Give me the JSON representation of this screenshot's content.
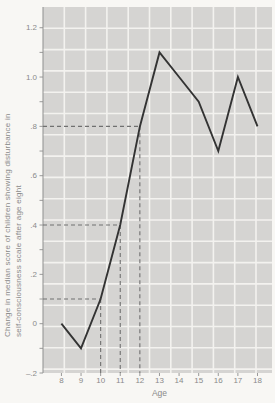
{
  "figure": {
    "paper_color": "#f8f7f4",
    "plot_bg_color": "#d5d4d2",
    "grid_color": "#f3f2ef",
    "line_color": "#333333",
    "dash_color": "#707070",
    "text_color": "#8a8a8a",
    "axis_color": "#8f8f8f"
  },
  "chart_data": {
    "type": "line",
    "title": "",
    "xlabel": "Age",
    "ylabel_lines": [
      "Change in median score of children showing disturbance in",
      "self-consciousness scale after age eight"
    ],
    "x": [
      8,
      9,
      10,
      11,
      12,
      13,
      14,
      15,
      16,
      17,
      18
    ],
    "values": [
      0,
      -0.1,
      0.1,
      0.4,
      0.8,
      1.1,
      1.0,
      0.9,
      0.7,
      1.0,
      0.8
    ],
    "xlim": [
      7.06,
      18.74
    ],
    "ylim": [
      -0.2,
      1.284
    ],
    "x_tick_labels": [
      "8",
      "9",
      "10",
      "11",
      "12",
      "13",
      "14",
      "15",
      "16",
      "17",
      "18"
    ],
    "x_tick_values": [
      8,
      9,
      10,
      11,
      12,
      13,
      14,
      15,
      16,
      17,
      18
    ],
    "y_tick_labels": [
      "1.2",
      "1.0",
      ".8",
      ".6",
      ".4",
      ".2",
      "0",
      "–.2"
    ],
    "y_tick_values": [
      1.2,
      1.0,
      0.8,
      0.6,
      0.4,
      0.2,
      0,
      -0.2
    ],
    "y_minor_tick_step": 0.1,
    "grid": "uniform square graph-paper grid, not aligned to ticks",
    "legend": null,
    "reference_dashed_lines": [
      {
        "y": 0.1,
        "x_to": 10
      },
      {
        "y": 0.4,
        "x_to": 11
      },
      {
        "y": 0.8,
        "x_to": 12
      }
    ]
  }
}
